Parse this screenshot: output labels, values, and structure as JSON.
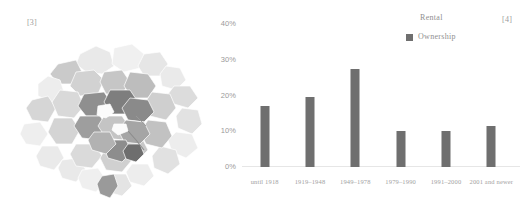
{
  "map": {
    "marker": "[3]",
    "name": "choropleth-map",
    "palette": [
      "#efefef",
      "#e4e4e4",
      "#d8d8d8",
      "#cccccc",
      "#c0c0c0",
      "#b4b4b4",
      "#a6a6a6",
      "#979797",
      "#8a8a8a",
      "#7c7c7c"
    ]
  },
  "chart": {
    "marker": "[4]",
    "legend": {
      "title": "Rental",
      "entries": [
        {
          "label": "Ownership",
          "color": "#6f6f6f"
        }
      ]
    }
  },
  "chart_data": {
    "type": "bar",
    "title": "",
    "subtitle": "",
    "xlabel": "",
    "ylabel": "",
    "categories": [
      "until 1918",
      "1919–1948",
      "1949–1978",
      "1979–1990",
      "1991–2000",
      "2001 and newer"
    ],
    "series": [
      {
        "name": "Ownership",
        "color": "#6f6f6f",
        "values": [
          17.0,
          19.5,
          27.5,
          10.0,
          10.0,
          11.5
        ]
      }
    ],
    "ylim": [
      0,
      40
    ],
    "yticks": [
      0,
      10,
      20,
      30,
      40
    ],
    "ytick_labels": [
      "0%",
      "10%",
      "20%",
      "30%",
      "40%"
    ],
    "grid": false,
    "legend_position": "top-right",
    "annotations": [
      "[3]",
      "[4]"
    ]
  }
}
